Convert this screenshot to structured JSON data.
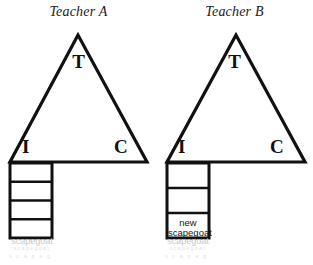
{
  "canvas": {
    "width": 313,
    "height": 265,
    "background": "#ffffff",
    "stroke_color": "#111111",
    "faded_text_color": "#c9c9c9"
  },
  "diagrams": [
    {
      "id": "teacher-a",
      "title": "Teacher A",
      "triangle": {
        "apex_label": "T",
        "left_label": "I",
        "right_label": "C",
        "apex": [
          78,
          35
        ],
        "base_left": [
          10,
          162
        ],
        "base_right": [
          147,
          162
        ]
      },
      "ladder": {
        "left": 10,
        "right": 52,
        "top": 163,
        "bottom": 238,
        "cell_count": 4,
        "divider_count": 3,
        "cells": [
          "",
          "",
          "",
          ""
        ]
      },
      "faded_label": "scapegoat"
    },
    {
      "id": "teacher-b",
      "title": "Teacher B",
      "triangle": {
        "apex_label": "T",
        "left_label": "I",
        "right_label": "C",
        "apex": [
          80,
          35
        ],
        "base_left": [
          11,
          162
        ],
        "base_right": [
          149,
          162
        ]
      },
      "ladder": {
        "left": 11,
        "right": 53,
        "top": 163,
        "bottom": 238,
        "cell_count": 3,
        "divider_count": 2,
        "cells": [
          "",
          "",
          "new scapegoat"
        ],
        "filled_cell_line_1": "new",
        "filled_cell_line_2": "scapegoat"
      },
      "faded_label": "scapegoat"
    }
  ]
}
